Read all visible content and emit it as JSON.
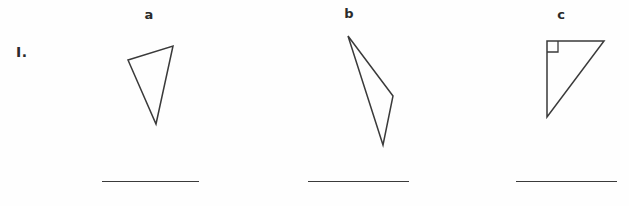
{
  "worksheet": {
    "problem_number": "I.",
    "background_color": "#fefefe",
    "stroke_color": "#3a3a3a",
    "text_color": "#2b2b2b"
  },
  "figures": [
    {
      "label": "a",
      "shape": "triangle",
      "description": "scalene triangle, no right angle marked",
      "has_right_angle_marker": false,
      "points": "128,60 173,46 156,124",
      "answer_line": true
    },
    {
      "label": "b",
      "shape": "triangle",
      "description": "narrow obtuse sliver triangle",
      "has_right_angle_marker": false,
      "points": "348,36 393,96 383,145",
      "answer_line": true
    },
    {
      "label": "c",
      "shape": "triangle",
      "description": "right triangle with square right-angle marker at top-left vertex",
      "has_right_angle_marker": true,
      "points": "547,41 604,41 547,117",
      "right_angle_marker": "547,52 558,52 558,41",
      "answer_line": true
    }
  ]
}
